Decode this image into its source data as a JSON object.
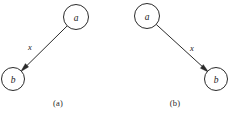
{
  "figure": {
    "background_color": "#ffffff",
    "stroke_color": "#2b2b2b",
    "text_color": "#1a1a1a"
  },
  "panels": [
    {
      "id": "a",
      "caption": "(a)",
      "nodes": [
        {
          "label": "a",
          "cx": 76,
          "cy": 17,
          "r": 12.5,
          "position": "upper-right"
        },
        {
          "label": "b",
          "cx": 13,
          "cy": 79,
          "r": 11.5,
          "position": "lower-left"
        }
      ],
      "edge": {
        "label": "x",
        "from": "a",
        "to": "b",
        "label_x": 30,
        "label_y": 47,
        "direction": "down-left"
      }
    },
    {
      "id": "b",
      "caption": "(b)",
      "nodes": [
        {
          "label": "a",
          "cx": 30,
          "cy": 16,
          "r": 12.5,
          "position": "upper-left"
        },
        {
          "label": "b",
          "cx": 99,
          "cy": 79,
          "r": 11.5,
          "position": "lower-right"
        }
      ],
      "edge": {
        "label": "x",
        "from": "a",
        "to": "b",
        "label_x": 75,
        "label_y": 48,
        "direction": "down-right"
      }
    }
  ]
}
